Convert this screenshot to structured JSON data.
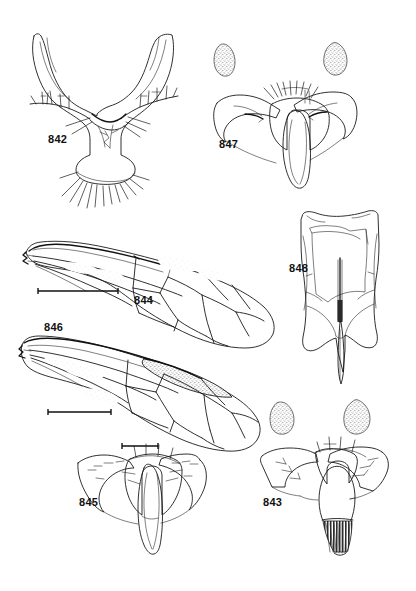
{
  "plate": {
    "title": "Taxonomic illustration plate, figures 842-848",
    "background_color": "#ffffff",
    "ink_color": "#1a1a1a",
    "width": 416,
    "height": 591
  },
  "figures": [
    {
      "id": "842",
      "label": "842",
      "caption_position": "left-of-figure",
      "subject": "forked-genital-structure",
      "description": "Y-shaped bifurcate sclerite with stippled surface, marginal setae rows and a fringe of long ventral setae",
      "has_scalebar": false,
      "has_satellite_blobs": false,
      "label_x": 48,
      "label_y": 133
    },
    {
      "id": "847",
      "label": "847",
      "caption_position": "left-of-figure",
      "subject": "winged-sclerite-with-median-lobe",
      "description": "Bat-shaped sclerite with recurved lateral arms, dorsal setal comb and an elongate median tongue-like lobe",
      "has_scalebar": false,
      "has_satellite_blobs": true,
      "satellite_blob_count": 2,
      "label_x": 219,
      "label_y": 138
    },
    {
      "id": "844",
      "label": "844",
      "caption_position": "below-figure",
      "subject": "wing",
      "description": "Elongate oval wing with complete venation, faint stippled patches in radial and discal cells",
      "has_scalebar": true,
      "has_satellite_blobs": false,
      "label_x": 134,
      "label_y": 294
    },
    {
      "id": "846",
      "label": "846",
      "caption_position": "above-figure",
      "subject": "wing",
      "description": "Elongate oval wing with complete venation and a dark stippled pterostigma along the costal margin",
      "has_scalebar": true,
      "has_satellite_blobs": false,
      "label_x": 44,
      "label_y": 321
    },
    {
      "id": "848",
      "label": "848",
      "caption_position": "left-of-figure",
      "subject": "sternite-with-median-spine",
      "description": "Elongate subrectangular plate with irregular margins and a median sclerotised rod projecting as a ventral spine",
      "has_scalebar": false,
      "has_satellite_blobs": false,
      "label_x": 289,
      "label_y": 262
    },
    {
      "id": "845",
      "label": "845",
      "caption_position": "left-of-figure",
      "subject": "winged-sclerite-with-median-lobe",
      "description": "Broad bat-shaped sclerite with pointed lateral lobes and a long tapering median lobe",
      "has_scalebar": true,
      "has_satellite_blobs": false,
      "label_x": 79,
      "label_y": 496
    },
    {
      "id": "843",
      "label": "843",
      "caption_position": "left-of-figure",
      "subject": "winged-sclerite-with-comb",
      "description": "Triangular winged sclerite with setae on the dorsal margin and a dark striated comb on the ventral process",
      "has_scalebar": false,
      "has_satellite_blobs": true,
      "satellite_blob_count": 2,
      "label_x": 263,
      "label_y": 496
    }
  ],
  "scalebars": [
    {
      "for_figure": "844",
      "x1": 38,
      "x2": 118,
      "y": 291
    },
    {
      "for_figure": "846",
      "x1": 48,
      "x2": 111,
      "y": 412
    },
    {
      "for_figure": "845",
      "x1": 122,
      "x2": 158,
      "y": 446
    }
  ]
}
